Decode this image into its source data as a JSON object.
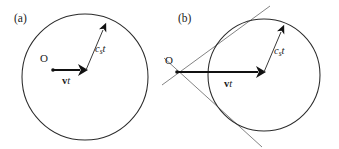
{
  "figure": {
    "background_color": "#ffffff",
    "line_color": "#2b2b2b",
    "tangent_color": "#6d6d6d",
    "vector_color": "#111111",
    "width": 339,
    "height": 149
  },
  "panels": [
    {
      "id": "panel-a",
      "label": "(a)",
      "label_x": 14,
      "label_y": 22,
      "regime": "subsonic",
      "circle": {
        "cx": 85,
        "cy": 77,
        "r": 63
      },
      "origin": {
        "label": "O",
        "x": 53,
        "y": 70,
        "label_x": 44,
        "label_y": 62
      },
      "velocity_vector": {
        "label": "vt",
        "symbol_bold": "v",
        "symbol_italic": "t",
        "x1": 53,
        "y1": 70,
        "x2": 86,
        "y2": 70,
        "label_x": 62,
        "label_y": 84
      },
      "sound_vector": {
        "label": "cst",
        "symbol_italic": "c",
        "symbol_sub": "s",
        "symbol_italic_2": "t",
        "x1": 86,
        "y1": 70,
        "x2": 106,
        "y2": 23,
        "label_x": 95,
        "label_y": 52
      },
      "tangents": []
    },
    {
      "id": "panel-b",
      "label": "(b)",
      "label_x": 178,
      "label_y": 22,
      "regime": "supersonic",
      "circle": {
        "cx": 264,
        "cy": 75,
        "r": 56
      },
      "origin": {
        "label": "O",
        "x": 177,
        "y": 72,
        "label_x": 169,
        "label_y": 64
      },
      "velocity_vector": {
        "label": "vt",
        "symbol_bold": "v",
        "symbol_italic": "t",
        "x1": 177,
        "y1": 72,
        "x2": 264,
        "y2": 72,
        "label_x": 228,
        "label_y": 87
      },
      "sound_vector": {
        "label": "cst",
        "symbol_italic": "c",
        "symbol_sub": "s",
        "symbol_italic_2": "t",
        "x1": 264,
        "y1": 72,
        "x2": 284,
        "y2": 25,
        "label_x": 274,
        "label_y": 54
      },
      "tangents": [
        {
          "name": "upper-tangent",
          "x1": 162,
          "y1": 85,
          "x2": 270,
          "y2": 6
        },
        {
          "name": "lower-tangent",
          "x1": 164,
          "y1": 58,
          "x2": 262,
          "y2": 147
        }
      ]
    }
  ]
}
